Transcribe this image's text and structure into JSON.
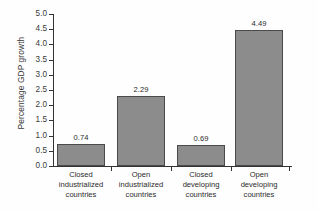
{
  "chart_data": {
    "type": "bar",
    "title": "",
    "xlabel": "",
    "ylabel": "Percentage GDP growth",
    "ylim": [
      0.0,
      5.0
    ],
    "grid": false,
    "legend": false,
    "categories": [
      "Closed industrialized countries",
      "Open industrialized countries",
      "Closed developing countries",
      "Open developing countries"
    ],
    "category_lines": [
      [
        "Closed",
        "industrialized",
        "countries"
      ],
      [
        "Open",
        "industrialized",
        "countries"
      ],
      [
        "Closed",
        "developing",
        "countries"
      ],
      [
        "Open",
        "developing",
        "countries"
      ]
    ],
    "values": [
      0.74,
      2.29,
      0.69,
      4.49
    ],
    "value_labels": [
      "0.74",
      "2.29",
      "0.69",
      "4.49"
    ],
    "ytick_labels": [
      "5.0",
      "4.5",
      "4.0",
      "3.5",
      "3.0",
      "2.5",
      "2.0",
      "1.5",
      "1.0",
      "0.5",
      "0.0"
    ],
    "ytick_values": [
      5.0,
      4.5,
      4.0,
      3.5,
      3.0,
      2.5,
      2.0,
      1.5,
      1.0,
      0.5,
      0.0
    ],
    "colors": {
      "bar_fill": "#8c8c8c",
      "bar_edge": "#4a4a4a",
      "axis": "#333333",
      "text": "#2b2b2b",
      "background": "#fefefe"
    }
  }
}
